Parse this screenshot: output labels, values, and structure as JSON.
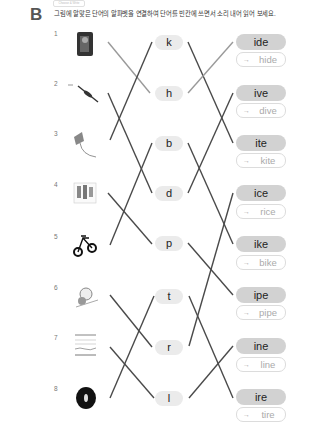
{
  "header": {
    "chip_label": "Choose & Write",
    "section_letter": "B",
    "instruction": "그림에 알맞은 단어의 알파벳을 연결하여 단어를 빈칸에 쓰면서 소리 내어 읽어 보세요."
  },
  "pictures": [
    {
      "num": "1",
      "icon": "hide-picture-icon",
      "label": "hiding person"
    },
    {
      "num": "2",
      "icon": "dive-picture-icon",
      "label": "diver"
    },
    {
      "num": "3",
      "icon": "kite-picture-icon",
      "label": "kite"
    },
    {
      "num": "4",
      "icon": "rice-picture-icon",
      "label": "rice"
    },
    {
      "num": "5",
      "icon": "bike-picture-icon",
      "label": "bike"
    },
    {
      "num": "6",
      "icon": "pipe-picture-icon",
      "label": "pipe"
    },
    {
      "num": "7",
      "icon": "line-picture-icon",
      "label": "lines"
    },
    {
      "num": "8",
      "icon": "tire-picture-icon",
      "label": "tire"
    }
  ],
  "letters": [
    "k",
    "h",
    "b",
    "d",
    "p",
    "t",
    "r",
    "l"
  ],
  "endings": [
    {
      "ending": "ide",
      "answer": "hide"
    },
    {
      "ending": "ive",
      "answer": "dive"
    },
    {
      "ending": "ite",
      "answer": "kite"
    },
    {
      "ending": "ice",
      "answer": "rice"
    },
    {
      "ending": "ike",
      "answer": "bike"
    },
    {
      "ending": "ipe",
      "answer": "pipe"
    },
    {
      "ending": "ine",
      "answer": "line"
    },
    {
      "ending": "ire",
      "answer": "tire"
    }
  ],
  "arrow_glyph": "→",
  "connections_left": [
    {
      "picture": "1",
      "letter": "h"
    },
    {
      "picture": "2",
      "letter": "d"
    },
    {
      "picture": "3",
      "letter": "k"
    },
    {
      "picture": "4",
      "letter": "p"
    },
    {
      "picture": "5",
      "letter": "b"
    },
    {
      "picture": "6",
      "letter": "r"
    },
    {
      "picture": "7",
      "letter": "l"
    },
    {
      "picture": "8",
      "letter": "t"
    }
  ],
  "connections_right": [
    {
      "letter": "k",
      "ending": "ite"
    },
    {
      "letter": "h",
      "ending": "ide"
    },
    {
      "letter": "b",
      "ending": "ike"
    },
    {
      "letter": "d",
      "ending": "ive"
    },
    {
      "letter": "p",
      "ending": "ipe"
    },
    {
      "letter": "t",
      "ending": "ire"
    },
    {
      "letter": "r",
      "ending": "ice"
    },
    {
      "letter": "l",
      "ending": "ine"
    }
  ],
  "colors": {
    "line": "#4a4a4a",
    "line_light": "#9a9a9a",
    "letter_bg": "#ebebeb",
    "ending_bg": "#d2d2d2",
    "answer_text": "#aaaaaa"
  }
}
